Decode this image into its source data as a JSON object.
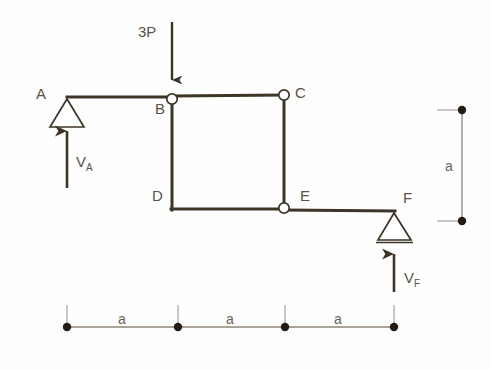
{
  "figure": {
    "type": "structural-frame-free-body-diagram",
    "colors": {
      "member": "#3d3527",
      "label": "#5a5145",
      "dimension_line": "#8d8578",
      "dimension_label": "#6b6358",
      "hinge_fill": "#ffffff",
      "background": "#fefefe"
    }
  },
  "joints": [
    {
      "id": "A",
      "label": "A",
      "x": 67,
      "y": 97,
      "label_x": 36,
      "label_y": 86,
      "kind": "pin-support"
    },
    {
      "id": "B",
      "label": "B",
      "x": 172,
      "y": 97,
      "label_x": 155,
      "label_y": 101,
      "kind": "hinge"
    },
    {
      "id": "C",
      "label": "C",
      "x": 284,
      "y": 95,
      "label_x": 295,
      "label_y": 85,
      "kind": "hinge"
    },
    {
      "id": "D",
      "label": "D",
      "x": 172,
      "y": 209,
      "label_x": 152,
      "label_y": 188,
      "kind": "rigid-corner"
    },
    {
      "id": "E",
      "label": "E",
      "x": 284,
      "y": 208,
      "label_x": 300,
      "label_y": 188,
      "kind": "hinge"
    },
    {
      "id": "F",
      "label": "F",
      "x": 394,
      "y": 211,
      "label_x": 403,
      "label_y": 190,
      "kind": "roller-support"
    }
  ],
  "loads": [
    {
      "id": "load-3P",
      "label": "3P",
      "label_x": 138,
      "label_y": 24,
      "direction": "down",
      "applied_at": "B",
      "x": 172,
      "y_start": 22,
      "y_end": 92
    }
  ],
  "reactions": [
    {
      "id": "reaction-VA",
      "label": "V",
      "subscript": "A",
      "label_x": 76,
      "label_y": 154,
      "direction": "up",
      "applied_at": "A",
      "x": 67,
      "y_start": 188,
      "y_end": 118
    },
    {
      "id": "reaction-VF",
      "label": "V",
      "subscript": "F",
      "label_x": 404,
      "label_y": 270,
      "direction": "up",
      "applied_at": "F",
      "x": 394,
      "y_start": 292,
      "y_end": 241
    }
  ],
  "dimensions": {
    "horizontal": {
      "axis_y": 327,
      "tick_top": 305,
      "ticks_x": [
        67,
        178,
        285,
        394
      ],
      "segments": [
        {
          "label": "a",
          "label_x": 118,
          "label_y": 312
        },
        {
          "label": "a",
          "label_x": 226,
          "label_y": 312
        },
        {
          "label": "a",
          "label_x": 334,
          "label_y": 312
        }
      ]
    },
    "vertical": {
      "axis_x": 462,
      "y_top": 110,
      "y_bottom": 221,
      "tick_left": 437,
      "label": "a",
      "label_x": 445,
      "label_y": 159
    }
  }
}
